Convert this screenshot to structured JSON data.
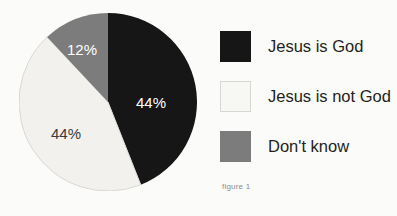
{
  "figure": {
    "caption": "figure 1",
    "background_color": "#fbfbfa"
  },
  "chart_data": {
    "type": "pie",
    "title": "",
    "subtitle": "",
    "xlabel": "",
    "ylabel": "",
    "categories": [
      "Jesus is God",
      "Jesus is not God",
      "Don't know"
    ],
    "values": [
      44,
      44,
      12
    ],
    "value_labels": [
      "44%",
      "44%",
      "12%"
    ],
    "colors": [
      "#161616",
      "#f2f1ed",
      "#7c7c7c"
    ],
    "label_text_colors": [
      "#ffffff",
      "#3a3a3a",
      "#ffffff"
    ],
    "units": "percent",
    "total": 100,
    "start_angle_deg": 0,
    "direction": "clockwise",
    "legend": {
      "position": "right",
      "entries": [
        {
          "label": "Jesus is God",
          "color": "#161616",
          "border_color": "#161616"
        },
        {
          "label": "Jesus is not God",
          "color": "#f7f7f4",
          "border_color": "#d6d6d2"
        },
        {
          "label": "Don't know",
          "color": "#7c7c7c",
          "border_color": "#7c7c7c"
        }
      ]
    },
    "grid": false,
    "annotations": [
      "figure 1"
    ]
  }
}
